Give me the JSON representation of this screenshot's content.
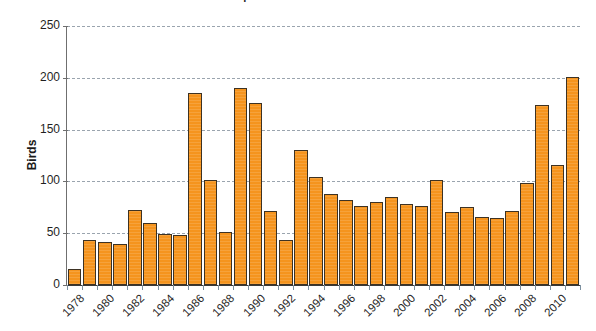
{
  "chart_data": {
    "type": "bar",
    "title": "Graph of annual bird counts",
    "xlabel": "",
    "ylabel": "Birds",
    "ylim": [
      0,
      250
    ],
    "ytick_values": [
      0,
      50,
      100,
      150,
      200,
      250
    ],
    "ytick_labels": [
      "0",
      "50",
      "100",
      "150",
      "200",
      "250"
    ],
    "grid": true,
    "legend": false,
    "bar_color": "#F5941E",
    "bar_edge_color": "#3d3223",
    "categories": [
      "1978",
      "1979",
      "1980",
      "1981",
      "1982",
      "1983",
      "1984",
      "1985",
      "1986",
      "1987",
      "1988",
      "1989",
      "1990",
      "1991",
      "1992",
      "1993",
      "1994",
      "1995",
      "1996",
      "1997",
      "1998",
      "1999",
      "2000",
      "2001",
      "2002",
      "2003",
      "2004",
      "2005",
      "2006",
      "2007",
      "2008",
      "2009",
      "2010",
      "2011"
    ],
    "xtick_labels": [
      "1978",
      "1980",
      "1982",
      "1984",
      "1986",
      "1988",
      "1990",
      "1992",
      "1994",
      "1996",
      "1998",
      "2000",
      "2002",
      "2004",
      "2006",
      "2008",
      "2010"
    ],
    "values": [
      15,
      43,
      42,
      40,
      72,
      60,
      49,
      48,
      185,
      101,
      51,
      190,
      176,
      71,
      43,
      130,
      104,
      88,
      82,
      76,
      80,
      85,
      78,
      76,
      101,
      70,
      75,
      66,
      65,
      71,
      98,
      174,
      116,
      101
    ],
    "last_value": 201
  }
}
